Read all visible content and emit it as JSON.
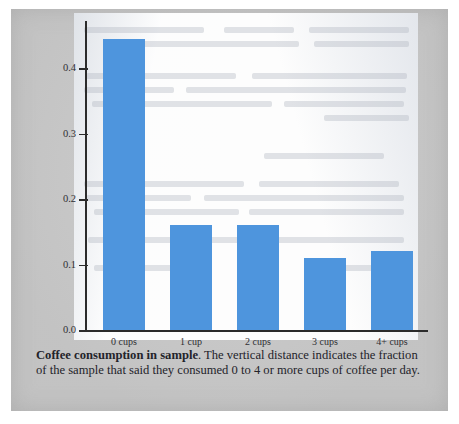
{
  "page": {
    "background_color": "#c9c9c9",
    "panel_color": "#fdfdfd"
  },
  "chart_data": {
    "type": "bar",
    "title": "Coffee consumption in sample",
    "categories": [
      "0 cups",
      "1 cup",
      "2 cups",
      "3 cups",
      "4+ cups"
    ],
    "values": [
      0.445,
      0.16,
      0.161,
      0.11,
      0.12
    ],
    "xlabel": "",
    "ylabel": "",
    "ylim": [
      0.0,
      0.46
    ],
    "yticks": [
      0.0,
      0.1,
      0.2,
      0.3,
      0.4
    ],
    "ytick_labels": [
      "0.0",
      "0.1",
      "0.2",
      "0.3",
      "0.4"
    ],
    "grid": false,
    "legend": false,
    "bar_color": "#4e95dd"
  },
  "caption": {
    "bold_lead": "Coffee consumption in sample",
    "body": ". The vertical distance indicates the fraction of the sample that said they consumed 0 to 4 or more cups of coffee per day."
  }
}
